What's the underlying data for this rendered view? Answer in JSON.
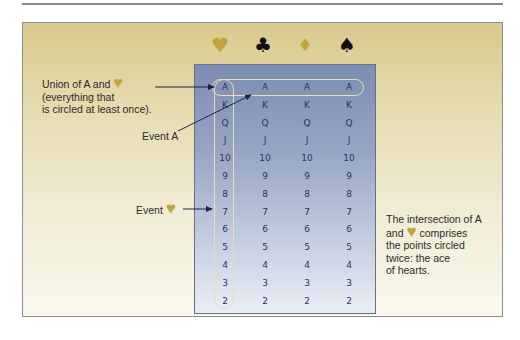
{
  "suits": [
    {
      "name": "heart",
      "glyph": "♥",
      "color": "#c2a43c"
    },
    {
      "name": "club",
      "glyph": "♣",
      "color": "#111111"
    },
    {
      "name": "diamond",
      "glyph": "♦",
      "color": "#c2a43c"
    },
    {
      "name": "spade",
      "glyph": "♠",
      "color": "#111111"
    }
  ],
  "ranks": [
    "A",
    "K",
    "Q",
    "J",
    "10",
    "9",
    "8",
    "7",
    "6",
    "5",
    "4",
    "3",
    "2"
  ],
  "annotations": {
    "union": {
      "line1": "Union of A and",
      "heart": "♥",
      "line2": "(everything that",
      "line3": "is circled at least once)."
    },
    "event_a": "Event A",
    "event_heart": {
      "text": "Event",
      "heart": "♥"
    },
    "intersection": {
      "line1": "The intersection of A",
      "line2_pre": "and",
      "heart": "♥",
      "line2_post": "comprises",
      "line3": "the points circled",
      "line4": "twice: the ace",
      "line5": "of hearts."
    }
  },
  "colors": {
    "gold": "#c2a43c",
    "frame_top": "#d9c98c",
    "panel_top": "#7d8cb3",
    "ring": "#e8deb0"
  }
}
